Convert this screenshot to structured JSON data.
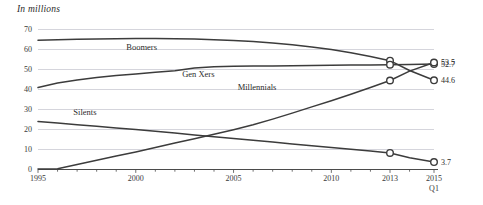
{
  "chart_data": {
    "type": "line",
    "title": "In millions",
    "xlabel": "",
    "ylabel": "",
    "ylim": [
      0,
      70
    ],
    "yticks": [
      0,
      10,
      20,
      30,
      40,
      50,
      60,
      70
    ],
    "ytick_labels": [
      "0",
      "10",
      "20",
      "30",
      "40",
      "50",
      "60",
      "70"
    ],
    "xlim": [
      1995,
      2015.25
    ],
    "xtick_labels": [
      "1995",
      "2000",
      "2005",
      "2010",
      "2013",
      "2015\nQ1"
    ],
    "xtick_values": [
      1995,
      2000,
      2005,
      2010,
      2013,
      2015.25
    ],
    "xtick_minor_step": 1,
    "grid": "horizontal",
    "legend": "inline-labels",
    "series": [
      {
        "name": "Boomers",
        "label": "Boomers",
        "label_x": 2000.3,
        "label_y": 60.0,
        "end_value": 44.6,
        "end_value_label": "44.6",
        "marker_years": [
          2013,
          2015.25
        ],
        "x": [
          1995,
          1996,
          1997,
          1998,
          1999,
          2000,
          2001,
          2002,
          2003,
          2004,
          2005,
          2006,
          2007,
          2008,
          2009,
          2010,
          2011,
          2012,
          2013,
          2014,
          2015.25
        ],
        "y": [
          64.6,
          64.9,
          65.1,
          65.3,
          65.4,
          65.5,
          65.5,
          65.4,
          65.2,
          64.9,
          64.5,
          64.0,
          63.3,
          62.4,
          61.3,
          60.0,
          58.4,
          56.5,
          54.4,
          49.5,
          44.6
        ]
      },
      {
        "name": "Gen Xers",
        "label": "Gen Xers",
        "label_x": 2003.2,
        "label_y": 46.5,
        "end_value": 52.7,
        "end_value_label": "52.7",
        "marker_years": [
          2013,
          2015.25
        ],
        "x": [
          1995,
          1996,
          1997,
          1998,
          1999,
          2000,
          2001,
          2002,
          2003,
          2004,
          2005,
          2006,
          2007,
          2008,
          2009,
          2010,
          2011,
          2012,
          2013,
          2014,
          2015.25
        ],
        "y": [
          41.0,
          43.2,
          44.8,
          46.0,
          47.0,
          47.8,
          48.6,
          49.4,
          50.8,
          51.4,
          51.6,
          51.7,
          51.8,
          51.9,
          52.0,
          52.1,
          52.2,
          52.3,
          52.4,
          52.5,
          52.7
        ]
      },
      {
        "name": "Millennials",
        "label": "Millennials",
        "label_x": 2006.2,
        "label_y": 40.0,
        "end_value": 53.5,
        "end_value_label": "53.5",
        "marker_years": [
          2013,
          2015.25
        ],
        "x": [
          1995,
          1996,
          1997,
          1998,
          1999,
          2000,
          2001,
          2002,
          2003,
          2004,
          2005,
          2006,
          2007,
          2008,
          2009,
          2010,
          2011,
          2012,
          2013,
          2014,
          2015.25
        ],
        "y": [
          0.3,
          0.4,
          2.5,
          4.6,
          6.7,
          8.8,
          11.0,
          13.2,
          15.4,
          17.6,
          19.9,
          22.4,
          25.2,
          28.2,
          31.3,
          34.4,
          37.6,
          41.0,
          44.5,
          49.2,
          53.5
        ]
      },
      {
        "name": "Silents",
        "label": "Silents",
        "label_x": 1997.4,
        "label_y": 27.3,
        "end_value": 3.7,
        "end_value_label": "3.7",
        "marker_years": [
          2013,
          2015.25
        ],
        "x": [
          1995,
          1996,
          1997,
          1998,
          1999,
          2000,
          2001,
          2002,
          2003,
          2004,
          2005,
          2006,
          2007,
          2008,
          2009,
          2010,
          2011,
          2012,
          2013,
          2014,
          2015.25
        ],
        "y": [
          24.0,
          23.2,
          22.4,
          21.6,
          20.8,
          20.0,
          19.1,
          18.2,
          17.3,
          16.4,
          15.5,
          14.6,
          13.7,
          12.8,
          11.9,
          11.0,
          10.1,
          9.2,
          8.3,
          5.9,
          3.7
        ]
      }
    ]
  }
}
